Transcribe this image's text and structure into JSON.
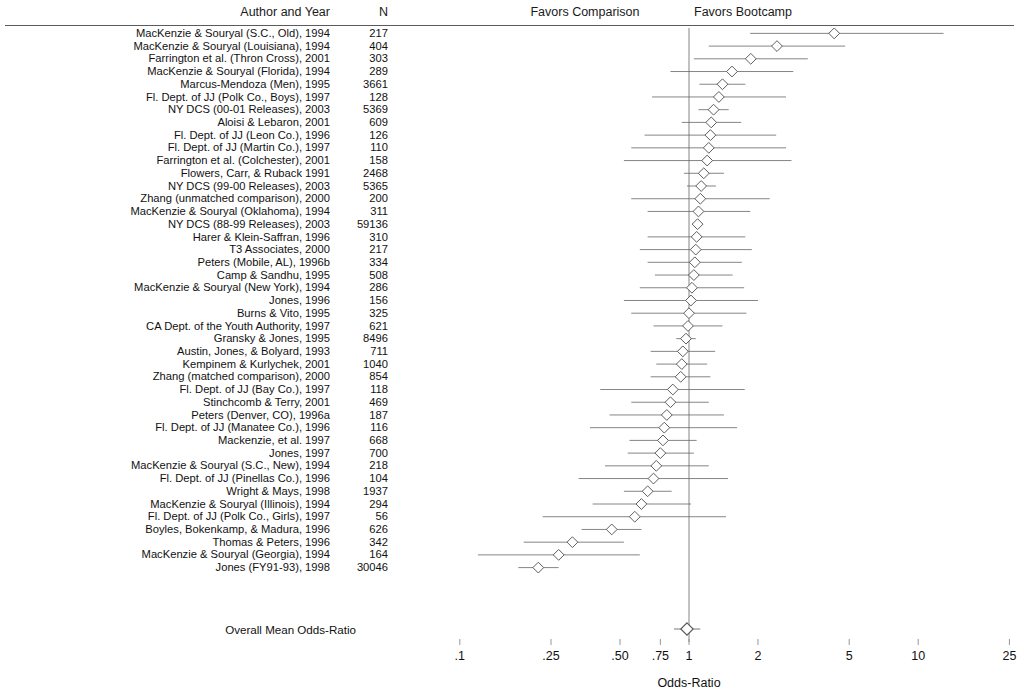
{
  "header": {
    "author_col": "Author and Year",
    "n_col": "N",
    "favors_left": "Favors Comparison",
    "favors_right": "Favors Bootcamp"
  },
  "overall_label": "Overall Mean Odds-Ratio",
  "chart_data": {
    "type": "forest",
    "title": "",
    "xlabel": "Odds-Ratio",
    "ylabel": "",
    "xscale": "log",
    "xlim": [
      0.1,
      25
    ],
    "xticks": [
      0.1,
      0.25,
      0.5,
      0.75,
      1,
      2,
      5,
      10,
      25
    ],
    "xtick_labels": [
      ".1",
      ".25",
      ".50",
      ".75",
      "1",
      "2",
      "5",
      "10",
      "25"
    ],
    "reference_line": 1,
    "grid": false,
    "legend": "none",
    "annotations": [
      "Favors Comparison",
      "Favors Bootcamp"
    ],
    "marker": "open-diamond",
    "columns": [
      "Author and Year",
      "N",
      "Odds-Ratio",
      "CI Low",
      "CI High"
    ],
    "studies": [
      {
        "label": "MacKenzie & Souryal (S.C., Old), 1994",
        "n": "217",
        "or": 4.3,
        "lo": 1.85,
        "hi": 12.9
      },
      {
        "label": "MacKenzie & Souryal (Louisiana), 1994",
        "n": "404",
        "or": 2.42,
        "lo": 1.22,
        "hi": 4.8
      },
      {
        "label": "Farrington et al. (Thron Cross), 2001",
        "n": "303",
        "or": 1.86,
        "lo": 1.05,
        "hi": 3.3
      },
      {
        "label": "MacKenzie & Souryal (Florida), 1994",
        "n": "289",
        "or": 1.54,
        "lo": 0.83,
        "hi": 2.85
      },
      {
        "label": "Marcus-Mendoza (Men), 1995",
        "n": "3661",
        "or": 1.4,
        "lo": 1.11,
        "hi": 1.76
      },
      {
        "label": "Fl. Dept. of JJ (Polk Co., Boys), 1997",
        "n": "128",
        "or": 1.35,
        "lo": 0.69,
        "hi": 2.65
      },
      {
        "label": "NY DCS (00-01 Releases), 2003",
        "n": "5369",
        "or": 1.28,
        "lo": 1.1,
        "hi": 1.49
      },
      {
        "label": "Aloisi & Lebaron, 2001",
        "n": "609",
        "or": 1.25,
        "lo": 0.93,
        "hi": 1.69
      },
      {
        "label": "Fl. Dept. of JJ (Leon Co.), 1996",
        "n": "126",
        "or": 1.24,
        "lo": 0.64,
        "hi": 2.4
      },
      {
        "label": "Fl. Dept. of JJ (Martin Co.), 1997",
        "n": "110",
        "or": 1.22,
        "lo": 0.56,
        "hi": 2.65
      },
      {
        "label": "Farrington et al. (Colchester), 2001",
        "n": "158",
        "or": 1.2,
        "lo": 0.52,
        "hi": 2.8
      },
      {
        "label": "Flowers, Carr, & Ruback 1991",
        "n": "2468",
        "or": 1.16,
        "lo": 0.95,
        "hi": 1.42
      },
      {
        "label": "NY DCS (99-00 Releases), 2003",
        "n": "5365",
        "or": 1.13,
        "lo": 0.98,
        "hi": 1.31
      },
      {
        "label": "Zhang (unmatched comparison), 2000",
        "n": "200",
        "or": 1.12,
        "lo": 0.56,
        "hi": 2.25
      },
      {
        "label": "MacKenzie & Souryal (Oklahoma), 1994",
        "n": "311",
        "or": 1.1,
        "lo": 0.66,
        "hi": 1.85
      },
      {
        "label": "NY DCS (88-99 Releases), 2003",
        "n": "59136",
        "or": 1.09,
        "lo": 1.03,
        "hi": 1.15
      },
      {
        "label": "Harer & Klein-Saffran, 1996",
        "n": "310",
        "or": 1.08,
        "lo": 0.66,
        "hi": 1.76
      },
      {
        "label": "T3 Associates, 2000",
        "n": "217",
        "or": 1.07,
        "lo": 0.61,
        "hi": 1.88
      },
      {
        "label": "Peters (Mobile, AL), 1996b",
        "n": "334",
        "or": 1.06,
        "lo": 0.66,
        "hi": 1.7
      },
      {
        "label": "Camp & Sandhu, 1995",
        "n": "508",
        "or": 1.05,
        "lo": 0.71,
        "hi": 1.55
      },
      {
        "label": "MacKenzie & Souryal (New York), 1994",
        "n": "286",
        "or": 1.03,
        "lo": 0.61,
        "hi": 1.74
      },
      {
        "label": "Jones, 1996",
        "n": "156",
        "or": 1.02,
        "lo": 0.52,
        "hi": 2.0
      },
      {
        "label": "Burns & Vito, 1995",
        "n": "325",
        "or": 1.0,
        "lo": 0.56,
        "hi": 1.78
      },
      {
        "label": "CA Dept. of the Youth Authority, 1997",
        "n": "621",
        "or": 0.99,
        "lo": 0.7,
        "hi": 1.4
      },
      {
        "label": "Gransky & Jones, 1995",
        "n": "8496",
        "or": 0.97,
        "lo": 0.88,
        "hi": 1.07
      },
      {
        "label": "Austin, Jones, & Bolyard, 1993",
        "n": "711",
        "or": 0.94,
        "lo": 0.68,
        "hi": 1.3
      },
      {
        "label": "Kempinem & Kurlychek, 2001",
        "n": "1040",
        "or": 0.93,
        "lo": 0.72,
        "hi": 1.2
      },
      {
        "label": "Zhang (matched comparison), 2000",
        "n": "854",
        "or": 0.92,
        "lo": 0.68,
        "hi": 1.24
      },
      {
        "label": "Fl. Dept. of JJ (Bay Co.), 1997",
        "n": "118",
        "or": 0.85,
        "lo": 0.41,
        "hi": 1.75
      },
      {
        "label": "Stinchcomb & Terry, 2001",
        "n": "469",
        "or": 0.83,
        "lo": 0.56,
        "hi": 1.22
      },
      {
        "label": "Peters (Denver, CO), 1996a",
        "n": "187",
        "or": 0.8,
        "lo": 0.45,
        "hi": 1.42
      },
      {
        "label": "Fl. Dept. of JJ (Manatee Co.), 1996",
        "n": "116",
        "or": 0.78,
        "lo": 0.37,
        "hi": 1.62
      },
      {
        "label": "Mackenzie, et al. 1997",
        "n": "668",
        "or": 0.77,
        "lo": 0.55,
        "hi": 1.08
      },
      {
        "label": "Jones, 1997",
        "n": "700",
        "or": 0.75,
        "lo": 0.54,
        "hi": 1.05
      },
      {
        "label": "MacKenzie & Souryal (S.C., New), 1994",
        "n": "218",
        "or": 0.72,
        "lo": 0.43,
        "hi": 1.22
      },
      {
        "label": "Fl. Dept. of JJ (Pinellas Co.), 1996",
        "n": "104",
        "or": 0.7,
        "lo": 0.33,
        "hi": 1.48
      },
      {
        "label": "Wright & Mays, 1998",
        "n": "1937",
        "or": 0.66,
        "lo": 0.52,
        "hi": 0.84
      },
      {
        "label": "MacKenzie & Souryal (Illinois), 1994",
        "n": "294",
        "or": 0.62,
        "lo": 0.38,
        "hi": 1.02
      },
      {
        "label": "Fl. Dept. of JJ (Polk Co., Girls), 1997",
        "n": "56",
        "or": 0.58,
        "lo": 0.23,
        "hi": 1.45
      },
      {
        "label": "Boyles, Bokenkamp, & Madura, 1996",
        "n": "626",
        "or": 0.46,
        "lo": 0.34,
        "hi": 0.62
      },
      {
        "label": "Thomas & Peters, 1996",
        "n": "342",
        "or": 0.31,
        "lo": 0.19,
        "hi": 0.52
      },
      {
        "label": "MacKenzie & Souryal (Georgia), 1994",
        "n": "164",
        "or": 0.27,
        "lo": 0.12,
        "hi": 0.61
      },
      {
        "label": "Jones (FY91-93), 1998",
        "n": "30046",
        "or": 0.22,
        "lo": 0.18,
        "hi": 0.27
      }
    ],
    "overall": {
      "label": "Overall Mean Odds-Ratio",
      "or": 0.98,
      "lo": 0.86,
      "hi": 1.12
    }
  },
  "colors": {
    "rule": "#5b5b5b",
    "marker_stroke": "#555555",
    "ci_line": "#666666",
    "reference_line": "#777777",
    "text": "#111111"
  }
}
